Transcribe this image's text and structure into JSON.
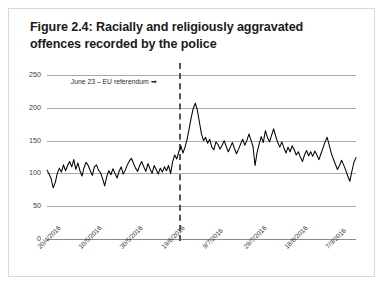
{
  "figure": {
    "title": "Figure 2.4: Racially and religiously aggravated offences recorded by the police"
  },
  "annotation": {
    "referendum_label": "June 23 – EU referendum ➡"
  },
  "chart_data": {
    "type": "line",
    "title": "Figure 2.4: Racially and religiously aggravated offences recorded by the police",
    "xlabel": "",
    "ylabel": "",
    "ylim": [
      0,
      250
    ],
    "yticks": [
      0,
      50,
      100,
      150,
      200,
      250
    ],
    "ytick_labels": [
      "0",
      "50",
      "100",
      "150",
      "200",
      "250"
    ],
    "grid": true,
    "legend": "none",
    "xtick_labels": [
      "20/4/2016",
      "10/5/2016",
      "30/5/2016",
      "19/6/2016",
      "9/7/2016",
      "29/7/2016",
      "18/8/2016",
      "7/9/2016"
    ],
    "xtick_indices": [
      0,
      20,
      40,
      60,
      80,
      100,
      120,
      140
    ],
    "annotations": [
      {
        "text": "June 23 – EU referendum ➡",
        "x_index": 64,
        "type": "vertical-dashed-line",
        "line_color": "#555555"
      }
    ],
    "series": [
      {
        "name": "Racially and religiously aggravated offences",
        "color": "#000000",
        "values": [
          105,
          99,
          92,
          78,
          86,
          100,
          108,
          102,
          113,
          104,
          112,
          118,
          110,
          121,
          106,
          116,
          104,
          96,
          109,
          117,
          112,
          104,
          97,
          110,
          113,
          105,
          101,
          92,
          81,
          95,
          104,
          98,
          107,
          100,
          93,
          103,
          110,
          99,
          105,
          113,
          119,
          123,
          115,
          108,
          103,
          112,
          118,
          110,
          103,
          115,
          107,
          100,
          112,
          106,
          99,
          108,
          102,
          110,
          104,
          112,
          100,
          118,
          128,
          122,
          133,
          142,
          131,
          140,
          152,
          168,
          185,
          199,
          207,
          196,
          178,
          160,
          150,
          155,
          146,
          152,
          140,
          136,
          148,
          144,
          137,
          143,
          150,
          141,
          133,
          140,
          147,
          138,
          130,
          137,
          145,
          152,
          143,
          150,
          160,
          151,
          141,
          112,
          132,
          145,
          156,
          147,
          165,
          155,
          148,
          158,
          168,
          157,
          147,
          140,
          148,
          139,
          131,
          140,
          133,
          142,
          136,
          128,
          133,
          125,
          118,
          128,
          135,
          127,
          133,
          126,
          134,
          128,
          121,
          130,
          139,
          148,
          155,
          143,
          131,
          122,
          114,
          106,
          112,
          120,
          113,
          105,
          96,
          88,
          103,
          117,
          124
        ]
      }
    ]
  }
}
